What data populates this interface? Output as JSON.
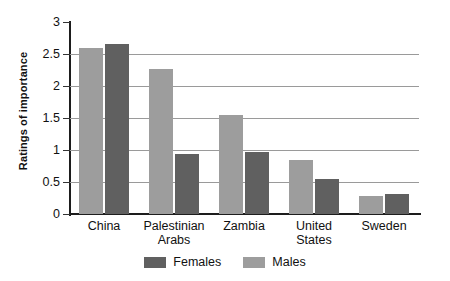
{
  "chart_data": {
    "type": "bar",
    "title": "",
    "subtitle": "",
    "xlabel": "",
    "ylabel": "Ratings of importance",
    "ylim": [
      0,
      3
    ],
    "ytick_step": 0.5,
    "yticks": [
      "3",
      "2.5",
      "2",
      "1.5",
      "1",
      "0.5",
      "0"
    ],
    "ytick_values": [
      3,
      2.5,
      2,
      1.5,
      1,
      0.5,
      0
    ],
    "gridlines": [
      2.5,
      2,
      1.5,
      1,
      0.5
    ],
    "grid": true,
    "grid_axis": "y",
    "legend_position": "bottom-center",
    "categories": [
      "China",
      "Palestinian Arabs",
      "Zambia",
      "United States",
      "Sweden"
    ],
    "category_lines": [
      [
        "China"
      ],
      [
        "Palestinian",
        "Arabs"
      ],
      [
        "Zambia"
      ],
      [
        "United",
        "States"
      ],
      [
        "Sweden"
      ]
    ],
    "bar_order_in_group": [
      "Males",
      "Females"
    ],
    "series": [
      {
        "name": "Females",
        "color": "#606060",
        "values": [
          2.65,
          0.93,
          0.97,
          0.55,
          0.32
        ]
      },
      {
        "name": "Males",
        "color": "#9d9d9d",
        "values": [
          2.6,
          2.26,
          1.55,
          0.85,
          0.28
        ]
      }
    ],
    "annotations": []
  },
  "legend": {
    "items": [
      {
        "label": "Females",
        "color": "#606060",
        "swatch": "legend-swatch-females"
      },
      {
        "label": "Males",
        "color": "#9d9d9d",
        "swatch": "legend-swatch-males"
      }
    ]
  },
  "axes": {
    "y_caption": "Ratings of importance",
    "axis_color": "#1d1d1d",
    "gridline_color": "#9a9a9a"
  }
}
